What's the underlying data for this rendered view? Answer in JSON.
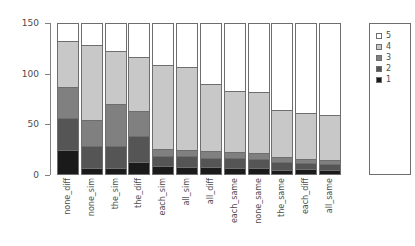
{
  "chart_data": {
    "type": "bar",
    "title": "",
    "subtitle": "",
    "xlabel": "",
    "ylabel": "",
    "stacked": true,
    "grid": false,
    "legend_position": "right",
    "ylim": [
      0,
      150
    ],
    "yticks": [
      0,
      50,
      100,
      150
    ],
    "ytick_labels": [
      "0",
      "50",
      "100",
      "150"
    ],
    "categories": [
      "none_diff",
      "none_sim",
      "the_sim",
      "the_diff",
      "each_sim",
      "all_sim",
      "all_diff",
      "each_same",
      "none_same",
      "the_same",
      "each_diff",
      "all_same"
    ],
    "series": [
      {
        "name": "1",
        "color": "#1a1a1a",
        "values": [
          23,
          5,
          5,
          11,
          7,
          6,
          6,
          5,
          5,
          3,
          4,
          3
        ]
      },
      {
        "name": "2",
        "color": "#555555",
        "values": [
          32,
          22,
          22,
          26,
          10,
          11,
          9,
          10,
          9,
          8,
          6,
          6
        ]
      },
      {
        "name": "3",
        "color": "#808080",
        "values": [
          31,
          26,
          42,
          25,
          7,
          6,
          7,
          6,
          6,
          5,
          4,
          4
        ]
      },
      {
        "name": "4",
        "color": "#c8c8c8",
        "values": [
          46,
          75,
          53,
          54,
          84,
          83,
          67,
          61,
          61,
          47,
          46,
          45
        ]
      },
      {
        "name": "5",
        "color": "#ffffff",
        "values": [
          18,
          22,
          28,
          34,
          42,
          44,
          61,
          68,
          69,
          87,
          90,
          92
        ]
      }
    ],
    "legend_entries": [
      {
        "label": "5",
        "color": "#ffffff"
      },
      {
        "label": "4",
        "color": "#c8c8c8"
      },
      {
        "label": "3",
        "color": "#808080"
      },
      {
        "label": "2",
        "color": "#555555"
      },
      {
        "label": "1",
        "color": "#1a1a1a"
      }
    ]
  }
}
